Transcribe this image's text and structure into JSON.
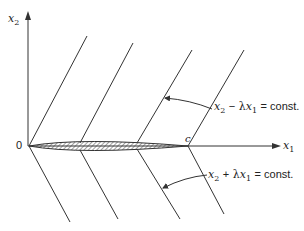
{
  "axes": {
    "x_axis_label_base": "x",
    "x_axis_label_sub": "1",
    "y_axis_label_base": "x",
    "y_axis_label_sub": "2",
    "origin_label": "0",
    "point_c_label": "c"
  },
  "annotations": {
    "upper": {
      "x_base": "x",
      "x_sub": "2",
      "op": "−",
      "lambda": "λ",
      "x2_base": "x",
      "x2_sub": "1",
      "rhs": "= const."
    },
    "lower": {
      "x_base": "x",
      "x_sub": "2",
      "op": "+",
      "lambda": "λ",
      "x2_base": "x",
      "x2_sub": "1",
      "rhs": "= const."
    }
  },
  "colors": {
    "line": "#333333",
    "hatch": "#444444"
  }
}
